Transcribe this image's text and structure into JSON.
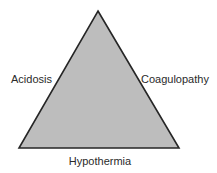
{
  "figure": {
    "name": "lethal-triad-triangle-diagram",
    "background_color": "#ffffff"
  },
  "shape": {
    "type": "triangle",
    "fill_color": "#bdbdbd",
    "stroke_color": "#262626",
    "stroke_width": 1.6,
    "vertices": {
      "apex": [
        98,
        11
      ],
      "bottom_left": [
        19,
        148
      ],
      "bottom_right": [
        179,
        148
      ]
    }
  },
  "labels": {
    "left": "Acidosis",
    "right": "Coagulopathy",
    "bottom": "Hypothermia",
    "text_color": "#2a2a2a",
    "font_size_px": 11
  }
}
